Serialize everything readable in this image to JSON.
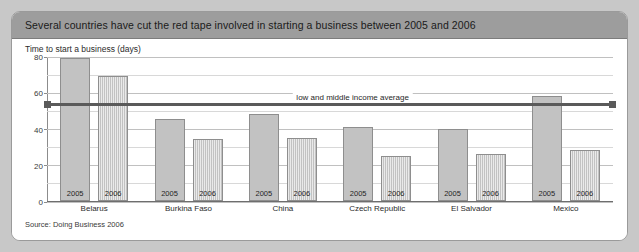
{
  "panel": {
    "title": "Several countries have cut the red tape involved in starting a business between 2005 and 2006",
    "subtitle": "Time to start a business (days)",
    "source": "Source: Doing Business 2006"
  },
  "chart_data": {
    "type": "bar",
    "title": "Several countries have cut the red tape involved in starting a business between 2005 and 2006",
    "subtitle": "Time to start a business (days)",
    "xlabel": "",
    "ylabel": "Time to start a business (days)",
    "ylim": [
      0,
      80
    ],
    "yticks": [
      0,
      20,
      40,
      60,
      80
    ],
    "ytick_labels": [
      "0",
      "20",
      "40",
      "60",
      "80"
    ],
    "minor_gridline_step": 10,
    "grid": true,
    "legend": "none",
    "categories": [
      "Belarus",
      "Burkina Faso",
      "China",
      "Czech Republic",
      "El Salvador",
      "Mexico"
    ],
    "series": [
      {
        "name": "2005",
        "values": [
          79,
          45,
          48,
          41,
          40,
          58
        ]
      },
      {
        "name": "2006",
        "values": [
          69,
          34,
          35,
          25,
          26,
          28
        ]
      }
    ],
    "annotations": [
      {
        "type": "hline",
        "label": "low and middle income average",
        "value": 54,
        "color": "#5a5a5a",
        "endcaps": "square"
      }
    ],
    "source": "Source: Doing Business 2006"
  },
  "colors": {
    "page_background": "#c8c8c8",
    "panel_background": "#ffffff",
    "header_background": "#9d9d9d",
    "bar_2005": "#c2c2c2",
    "bar_2006": "#c2c2c2",
    "bar_border": "#8e8e8e",
    "average_line": "#5a5a5a",
    "gridline": "#d8d8d8",
    "axis": "#6e6e6e"
  }
}
